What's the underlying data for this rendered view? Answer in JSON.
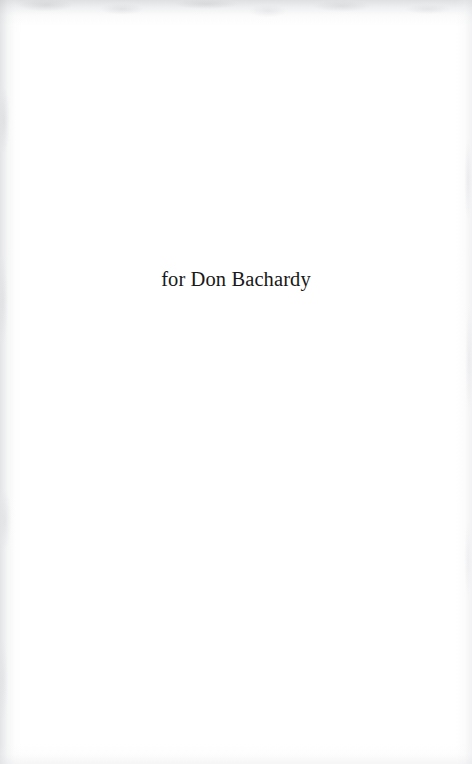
{
  "page": {
    "kind": "book-dedication-page",
    "background_color": "#ffffff",
    "text_color": "#181818",
    "width": 472,
    "height": 764
  },
  "dedication": {
    "text": "for Don Bachardy"
  },
  "scan_artifacts": {
    "top_edge_shade": "#c4c6c9",
    "left_edge_shade": "#c6c8cb",
    "right_edge_shade": "#dedfe2",
    "bottom_edge_shade": "#e2e3e6"
  }
}
